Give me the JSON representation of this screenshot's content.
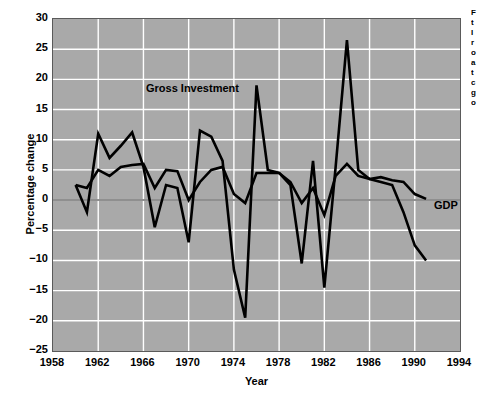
{
  "figure": {
    "background": "#ffffff",
    "plot_background": "#a9a9a9",
    "gridline_color": "#ffffff",
    "line_color": "#000000",
    "axis_title_y": "Percentage change",
    "axis_title_x": "Year"
  },
  "annotations": {
    "gross_investment": "Gross Investment",
    "gdp": "GDP"
  },
  "side_caption": {
    "lines": [
      "F",
      "t",
      "I",
      "r",
      "o",
      "a",
      "t",
      "c",
      "g",
      "o"
    ]
  },
  "chart_data": {
    "type": "line",
    "title": "",
    "subtitle": "",
    "xlabel": "Year",
    "ylabel": "Percentage change",
    "xlim": [
      1958,
      1994
    ],
    "ylim": [
      -25,
      30
    ],
    "xticks": [
      1958,
      1962,
      1966,
      1970,
      1974,
      1978,
      1982,
      1986,
      1990,
      1994
    ],
    "yticks": [
      -25,
      -20,
      -15,
      -10,
      -5,
      0,
      5,
      10,
      15,
      20,
      25,
      30
    ],
    "grid": true,
    "legend": "inline-annotations",
    "series": [
      {
        "name": "Gross Investment",
        "x": [
          1960,
          1961,
          1962,
          1963,
          1964,
          1965,
          1966,
          1967,
          1968,
          1969,
          1970,
          1971,
          1972,
          1973,
          1974,
          1975,
          1976,
          1977,
          1978,
          1979,
          1980,
          1981,
          1982,
          1983,
          1984,
          1985,
          1986,
          1987,
          1988,
          1989,
          1990,
          1991
        ],
        "values": [
          2.5,
          -2.0,
          11.0,
          7.0,
          9.0,
          11.2,
          5.5,
          -4.5,
          2.5,
          2.0,
          -7.0,
          11.5,
          10.5,
          6.5,
          -11.5,
          -19.5,
          19.0,
          5.0,
          4.5,
          2.5,
          -10.5,
          6.5,
          -14.5,
          5.5,
          26.5,
          5.0,
          3.5,
          3.0,
          2.5,
          -2.0,
          -7.5,
          -10.0
        ]
      },
      {
        "name": "GDP",
        "x": [
          1960,
          1961,
          1962,
          1963,
          1964,
          1965,
          1966,
          1967,
          1968,
          1969,
          1970,
          1971,
          1972,
          1973,
          1974,
          1975,
          1976,
          1977,
          1978,
          1979,
          1980,
          1981,
          1982,
          1983,
          1984,
          1985,
          1986,
          1987,
          1988,
          1989,
          1990,
          1991
        ],
        "values": [
          2.5,
          2.0,
          5.0,
          4.0,
          5.5,
          5.8,
          6.0,
          2.0,
          5.0,
          4.8,
          0.0,
          3.0,
          5.0,
          5.5,
          1.0,
          -0.5,
          4.5,
          4.5,
          4.5,
          3.0,
          -0.5,
          2.0,
          -2.5,
          4.0,
          6.0,
          4.0,
          3.5,
          3.8,
          3.3,
          3.0,
          1.0,
          0.2
        ]
      }
    ]
  }
}
